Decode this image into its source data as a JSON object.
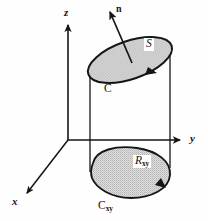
{
  "figure": {
    "background_color": "#fefefe",
    "ink_color": "#151515",
    "fill_color": "#d2d2d2"
  },
  "axes": {
    "z": {
      "label": "z",
      "name": "z-axis"
    },
    "y": {
      "label": "y",
      "name": "y-axis"
    },
    "x": {
      "label": "x",
      "name": "x-axis"
    },
    "origin": {
      "x": 68,
      "y": 140
    }
  },
  "normal_vector": {
    "label": "n",
    "tail": {
      "x": 132,
      "y": 63
    },
    "tip": {
      "x": 110,
      "y": 12
    }
  },
  "surface": {
    "label": "S",
    "name": "surface-s",
    "boundary_label": "C",
    "center": {
      "x": 130,
      "y": 60
    },
    "rx": 44,
    "ry": 19,
    "rotation_deg": -19
  },
  "projection": {
    "label": "R",
    "label_subscript": "xy",
    "name": "region-rxy",
    "boundary_label": "C",
    "boundary_subscript": "xy",
    "center": {
      "x": 130,
      "y": 173
    },
    "rx": 40,
    "ry": 25
  },
  "cylinder": {
    "left_line_x": 90,
    "right_line_x": 170,
    "top_y": 76,
    "bottom_y": 170
  }
}
